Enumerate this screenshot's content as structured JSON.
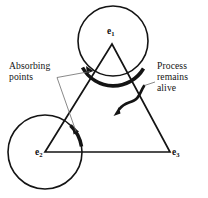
{
  "figure": {
    "name": "absorbing-points-triangle-diagram",
    "width": 208,
    "height": 198,
    "background_color": "#ffffff",
    "stroke_color": "#141414"
  },
  "annotations": {
    "absorbing": {
      "line1": "Absorbing",
      "line2": "points",
      "full_text": "Absorbing points",
      "position": "left",
      "leader_targets": [
        "top-absorbing-arc",
        "left-absorbing-arc"
      ]
    },
    "process": {
      "line1": "Process",
      "line2": "remains",
      "line3": "alive",
      "full_text": "Process remains alive",
      "position": "right",
      "leader_target": "triangle-interior"
    }
  },
  "vertices": [
    {
      "id": "e1",
      "label_base": "e",
      "label_sub": "1",
      "x": 112,
      "y": 44,
      "position": "apex-top",
      "has_circle": true
    },
    {
      "id": "e2",
      "label_base": "e",
      "label_sub": "2",
      "x": 45,
      "y": 152,
      "position": "bottom-left",
      "has_circle": true
    },
    {
      "id": "e3",
      "label_base": "e",
      "label_sub": "3",
      "x": 170,
      "y": 152,
      "position": "bottom-right",
      "has_circle": false
    }
  ],
  "shapes": {
    "triangle": {
      "points": "112,44 45,152 170,152",
      "stroke_width": 1.7
    },
    "circles": [
      {
        "center_vertex": "e1",
        "cx": 113,
        "cy": 41,
        "r": 35,
        "stroke_width": 1.6
      },
      {
        "center_vertex": "e2",
        "cx": 45,
        "cy": 152,
        "r": 37,
        "stroke_width": 1.6
      }
    ],
    "absorbing_arcs": [
      {
        "id": "top-absorbing-arc",
        "stroke_width": 3.4,
        "near_vertex": "e1"
      },
      {
        "id": "left-absorbing-arc",
        "stroke_width": 3.4,
        "near_vertex": "e2"
      }
    ],
    "interior_arrow": {
      "id": "process-alive-arrow",
      "stroke_width": 2.6,
      "direction": "down-left",
      "arrowhead": true
    }
  }
}
